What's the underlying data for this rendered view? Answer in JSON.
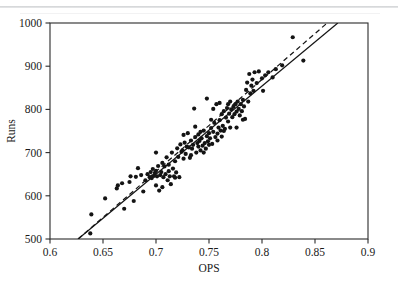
{
  "chart_data": {
    "type": "scatter",
    "title": "",
    "xlabel": "OPS",
    "ylabel": "Runs",
    "xlim": [
      0.6,
      0.9
    ],
    "ylim": [
      500,
      1000
    ],
    "xticks": [
      0.6,
      0.65,
      0.7,
      0.75,
      0.8,
      0.85,
      0.9
    ],
    "xtick_labels": [
      "0.6",
      "0.65",
      "0.7",
      "0.75",
      "0.8",
      "0.85",
      "0.9"
    ],
    "yticks": [
      500,
      600,
      700,
      800,
      900,
      1000
    ],
    "ytick_labels": [
      "500",
      "600",
      "700",
      "800",
      "900",
      "1000"
    ],
    "grid": false,
    "legend": null,
    "marker": {
      "shape": "circle",
      "color": "#141414",
      "size": 4
    },
    "series": [
      {
        "name": "Team seasons",
        "points": [
          [
            0.638,
            513
          ],
          [
            0.639,
            557
          ],
          [
            0.652,
            594
          ],
          [
            0.663,
            617
          ],
          [
            0.664,
            624
          ],
          [
            0.668,
            629
          ],
          [
            0.67,
            570
          ],
          [
            0.675,
            632
          ],
          [
            0.676,
            645
          ],
          [
            0.679,
            588
          ],
          [
            0.681,
            644
          ],
          [
            0.683,
            664
          ],
          [
            0.686,
            648
          ],
          [
            0.688,
            610
          ],
          [
            0.69,
            636
          ],
          [
            0.692,
            650
          ],
          [
            0.694,
            643
          ],
          [
            0.695,
            655
          ],
          [
            0.696,
            641
          ],
          [
            0.697,
            662
          ],
          [
            0.698,
            646
          ],
          [
            0.699,
            653
          ],
          [
            0.7,
            658
          ],
          [
            0.7,
            624
          ],
          [
            0.701,
            645
          ],
          [
            0.702,
            669
          ],
          [
            0.703,
            612
          ],
          [
            0.704,
            648
          ],
          [
            0.705,
            655
          ],
          [
            0.706,
            676
          ],
          [
            0.707,
            643
          ],
          [
            0.708,
            668
          ],
          [
            0.709,
            650
          ],
          [
            0.71,
            689
          ],
          [
            0.711,
            636
          ],
          [
            0.712,
            657
          ],
          [
            0.713,
            645
          ],
          [
            0.714,
            627
          ],
          [
            0.715,
            700
          ],
          [
            0.716,
            663
          ],
          [
            0.717,
            645
          ],
          [
            0.718,
            680
          ],
          [
            0.719,
            654
          ],
          [
            0.72,
            710
          ],
          [
            0.721,
            690
          ],
          [
            0.722,
            643
          ],
          [
            0.723,
            719
          ],
          [
            0.724,
            702
          ],
          [
            0.725,
            705
          ],
          [
            0.726,
            686
          ],
          [
            0.727,
            723
          ],
          [
            0.728,
            697
          ],
          [
            0.729,
            714
          ],
          [
            0.73,
            745
          ],
          [
            0.731,
            712
          ],
          [
            0.732,
            688
          ],
          [
            0.733,
            728
          ],
          [
            0.734,
            709
          ],
          [
            0.735,
            718
          ],
          [
            0.736,
            802
          ],
          [
            0.737,
            736
          ],
          [
            0.738,
            700
          ],
          [
            0.739,
            722
          ],
          [
            0.74,
            714
          ],
          [
            0.74,
            742
          ],
          [
            0.741,
            727
          ],
          [
            0.742,
            705
          ],
          [
            0.743,
            733
          ],
          [
            0.744,
            716
          ],
          [
            0.745,
            751
          ],
          [
            0.746,
            722
          ],
          [
            0.747,
            709
          ],
          [
            0.748,
            825
          ],
          [
            0.748,
            738
          ],
          [
            0.749,
            726
          ],
          [
            0.75,
            745
          ],
          [
            0.75,
            718
          ],
          [
            0.751,
            733
          ],
          [
            0.752,
            757
          ],
          [
            0.753,
            720
          ],
          [
            0.754,
            748
          ],
          [
            0.755,
            769
          ],
          [
            0.756,
            736
          ],
          [
            0.757,
            812
          ],
          [
            0.758,
            744
          ],
          [
            0.759,
            758
          ],
          [
            0.76,
            815
          ],
          [
            0.76,
            775
          ],
          [
            0.761,
            751
          ],
          [
            0.762,
            789
          ],
          [
            0.763,
            762
          ],
          [
            0.764,
            796
          ],
          [
            0.765,
            755
          ],
          [
            0.766,
            781
          ],
          [
            0.767,
            803
          ],
          [
            0.768,
            772
          ],
          [
            0.769,
            790
          ],
          [
            0.77,
            758
          ],
          [
            0.771,
            800
          ],
          [
            0.772,
            782
          ],
          [
            0.773,
            806
          ],
          [
            0.774,
            789
          ],
          [
            0.775,
            812
          ],
          [
            0.776,
            795
          ],
          [
            0.777,
            818
          ],
          [
            0.778,
            801
          ],
          [
            0.779,
            786
          ],
          [
            0.78,
            812
          ],
          [
            0.781,
            796
          ],
          [
            0.782,
            822
          ],
          [
            0.783,
            807
          ],
          [
            0.784,
            778
          ],
          [
            0.785,
            845
          ],
          [
            0.786,
            862
          ],
          [
            0.787,
            818
          ],
          [
            0.788,
            882
          ],
          [
            0.789,
            837
          ],
          [
            0.79,
            855
          ],
          [
            0.791,
            869
          ],
          [
            0.792,
            843
          ],
          [
            0.793,
            886
          ],
          [
            0.795,
            861
          ],
          [
            0.797,
            888
          ],
          [
            0.8,
            872
          ],
          [
            0.801,
            843
          ],
          [
            0.803,
            879
          ],
          [
            0.806,
            886
          ],
          [
            0.81,
            874
          ],
          [
            0.813,
            893
          ],
          [
            0.819,
            902
          ],
          [
            0.829,
            967
          ],
          [
            0.839,
            913
          ],
          [
            0.712,
            672
          ],
          [
            0.726,
            741
          ],
          [
            0.733,
            694
          ],
          [
            0.745,
            700
          ],
          [
            0.752,
            776
          ],
          [
            0.758,
            728
          ],
          [
            0.764,
            750
          ],
          [
            0.77,
            818
          ],
          [
            0.776,
            758
          ],
          [
            0.782,
            776
          ],
          [
            0.7,
            700
          ],
          [
            0.706,
            620
          ],
          [
            0.718,
            642
          ],
          [
            0.737,
            760
          ],
          [
            0.742,
            748
          ],
          [
            0.754,
            801
          ],
          [
            0.762,
            737
          ],
          [
            0.768,
            812
          ]
        ]
      }
    ],
    "fit_lines": [
      {
        "name": "regression-line",
        "style": "solid",
        "x1": 0.6265,
        "y1": 500,
        "x2": 0.8715,
        "y2": 1000
      },
      {
        "name": "reference-line",
        "style": "dashed",
        "x1": 0.6265,
        "y1": 500,
        "x2": 0.8615,
        "y2": 1000
      }
    ]
  }
}
